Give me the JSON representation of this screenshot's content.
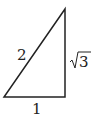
{
  "diagram": {
    "type": "right-triangle",
    "labels": {
      "hypotenuse": "2",
      "base": "1",
      "height_radicand": "3",
      "height_full": "√3"
    },
    "stroke_color": "#222222"
  }
}
